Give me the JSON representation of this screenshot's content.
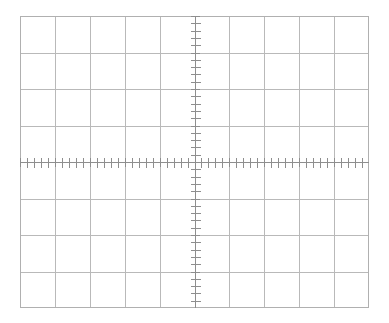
{
  "app": {
    "title": "Oscilloscope Graticule",
    "background_color": "#ffffff"
  },
  "graticule": {
    "name": "oscilloscope-graticule",
    "description": "Blank oscilloscope display graticule",
    "origin_x": 20,
    "origin_y": 16,
    "width": 349,
    "height": 292,
    "divisions_horizontal": 10,
    "divisions_vertical": 8,
    "division_width_px": 34.9,
    "division_height_px": 36.5,
    "subdivisions_per_division": 5,
    "center_axis_x": 194.5,
    "center_axis_y": 162,
    "grid_line_color": "#b9b9b9",
    "border_color": "#b0b0b0",
    "axis_color": "#8e8e8e",
    "tick_color": "#8e8e8e",
    "tick_length_px": 9,
    "axis_tick_length_px": 5,
    "show_grid": true,
    "show_center_axes": true,
    "show_minor_ticks": true
  },
  "chart_data": {
    "type": "line",
    "title": "",
    "subtitle": "",
    "xlabel": "",
    "ylabel": "",
    "series": [],
    "categories": [],
    "values": [],
    "xlim": [
      -5,
      5
    ],
    "ylim": [
      -4,
      4
    ],
    "xticks": [
      -5,
      -4,
      -3,
      -2,
      -1,
      0,
      1,
      2,
      3,
      4,
      5
    ],
    "yticks": [
      -4,
      -3,
      -2,
      -1,
      0,
      1,
      2,
      3,
      4
    ],
    "xtick_labels": [
      "",
      "",
      "",
      "",
      "",
      "",
      "",
      "",
      "",
      "",
      ""
    ],
    "ytick_labels": [
      "",
      "",
      "",
      "",
      "",
      "",
      "",
      "",
      ""
    ],
    "grid": true,
    "legend": [],
    "legend_position": "none",
    "annotations": []
  }
}
